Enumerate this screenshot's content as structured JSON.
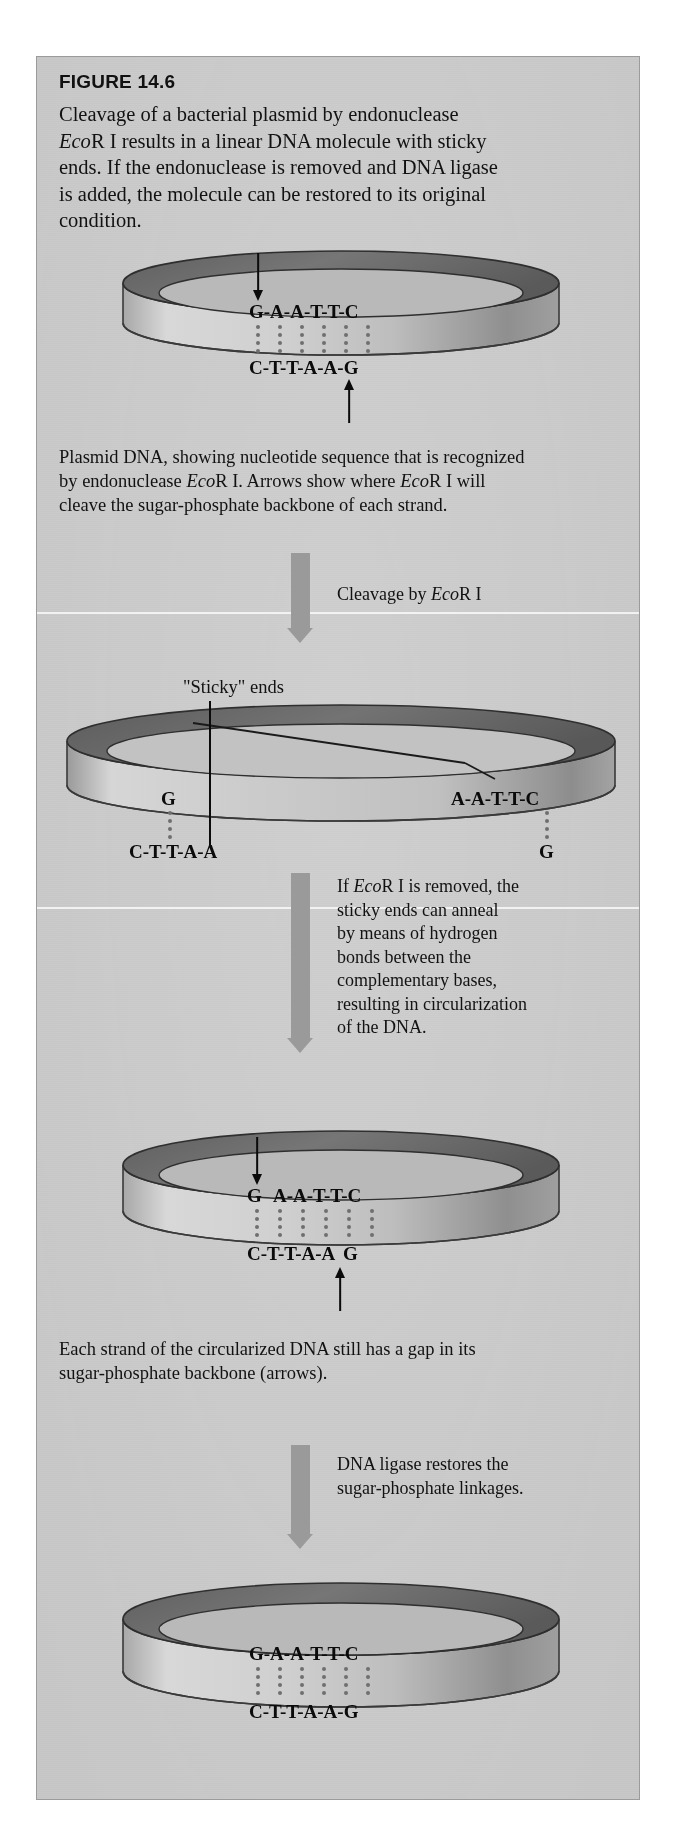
{
  "figure": {
    "number": "FIGURE 14.6",
    "caption_line1": "Cleavage of a bacterial plasmid by endonuclease",
    "caption_eco": "Eco",
    "caption_line2_rest": "R I results in a linear DNA molecule with sticky",
    "caption_line3": "ends. If the endonuclease is removed and DNA ligase",
    "caption_line4": "is added, the molecule can be restored to its original",
    "caption_line5": "condition."
  },
  "steps": {
    "step1_caption_line1": "Plasmid DNA, showing nucleotide sequence that is recognized",
    "step1_caption_line2_a": "by endonuclease ",
    "step1_caption_line2_eco": "Eco",
    "step1_caption_line2_b": "R I. Arrows show where ",
    "step1_caption_line2_eco2": "Eco",
    "step1_caption_line2_c": "R I will",
    "step1_caption_line3": "cleave the sugar-phosphate backbone of each strand.",
    "arrow1_label_a": "Cleavage by ",
    "arrow1_label_eco": "Eco",
    "arrow1_label_b": "R I",
    "sticky_label": "\"Sticky\" ends",
    "arrow2_label_line1_a": "If ",
    "arrow2_label_line1_eco": "Eco",
    "arrow2_label_line1_b": "R I is removed, the",
    "arrow2_label_line2": "sticky ends can anneal",
    "arrow2_label_line3": "by means of hydrogen",
    "arrow2_label_line4": "bonds between the",
    "arrow2_label_line5": "complementary bases,",
    "arrow2_label_line6": "resulting in circularization",
    "arrow2_label_line7": "of the DNA.",
    "step3_caption_line1": "Each strand of the circularized DNA still has a gap in its",
    "step3_caption_line2": "sugar-phosphate backbone (arrows).",
    "arrow3_label_line1": "DNA ligase restores the",
    "arrow3_label_line2": "sugar-phosphate linkages."
  },
  "plasmids": {
    "p1": {
      "top_sequence": "G-A-A-T-T-C",
      "bottom_sequence": "C-T-T-A-A-G",
      "hydrogen_bond_columns": 6,
      "has_down_arrow": true,
      "has_up_arrow": true
    },
    "p2": {
      "top_left_sequence": "G",
      "top_right_sequence": "A-A-T-T-C",
      "bottom_left_sequence": "C-T-T-A-A",
      "bottom_right_sequence": "G",
      "hydrogen_bond_columns_left": 1,
      "hydrogen_bond_columns_right": 1
    },
    "p3": {
      "top_sequence_gap_first": "G",
      "top_sequence_rest": "A-A-T-T-C",
      "bottom_sequence_first": "C-T-T-A-A",
      "bottom_sequence_gap_last": "G",
      "hydrogen_bond_columns": 6,
      "has_down_arrow": true,
      "has_up_arrow": true
    },
    "p4": {
      "top_sequence": "G-A-A-T-T-C",
      "bottom_sequence": "C-T-T-A-A-G",
      "hydrogen_bond_columns": 6,
      "has_down_arrow": false,
      "has_up_arrow": false
    }
  },
  "colors": {
    "panel_background": "#c9c9c9",
    "ring_top_dark": "#6e6e6e",
    "ring_band_light": "#cfcfcf",
    "process_arrow": "#9a9a9a",
    "text": "#121212",
    "hbond_dot": "#6f6f6f"
  }
}
